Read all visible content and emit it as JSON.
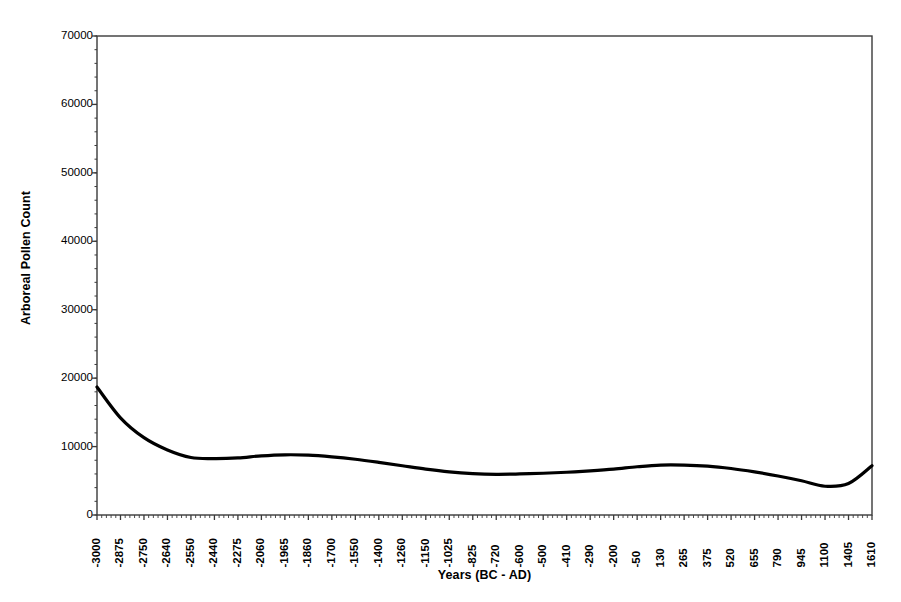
{
  "chart_data": {
    "type": "line",
    "title": "",
    "xlabel": "Years (BC - AD)",
    "ylabel": "Arboreal Pollen Count",
    "ylim": [
      0,
      70000
    ],
    "ytick_values": [
      0,
      10000,
      20000,
      30000,
      40000,
      50000,
      60000,
      70000
    ],
    "ytick_labels": [
      "0",
      "10000",
      "20000",
      "30000",
      "40000",
      "50000",
      "60000",
      "70000"
    ],
    "grid": false,
    "legend": "none",
    "xtick_labels": [
      "-3000",
      "-2875",
      "-2750",
      "-2640",
      "-2550",
      "-2440",
      "-2275",
      "-2060",
      "-1965",
      "-1860",
      "-1700",
      "-1550",
      "-1400",
      "-1260",
      "-1150",
      "-1025",
      "-825",
      "-720",
      "-600",
      "-500",
      "-410",
      "-290",
      "-200",
      "-50",
      "130",
      "265",
      "375",
      "520",
      "655",
      "790",
      "945",
      "1100",
      "1405",
      "1610"
    ],
    "x": [
      "-3000",
      "-2875",
      "-2750",
      "-2640",
      "-2550",
      "-2440",
      "-2275",
      "-2060",
      "-1965",
      "-1860",
      "-1700",
      "-1550",
      "-1400",
      "-1260",
      "-1150",
      "-1025",
      "-825",
      "-720",
      "-600",
      "-500",
      "-410",
      "-290",
      "-200",
      "-50",
      "130",
      "265",
      "375",
      "520",
      "655",
      "790",
      "945",
      "1100",
      "1405",
      "1610"
    ],
    "values": [
      18700,
      14200,
      11300,
      9500,
      8400,
      8250,
      8350,
      8650,
      8800,
      8750,
      8500,
      8150,
      7700,
      7200,
      6700,
      6300,
      6050,
      5950,
      6000,
      6100,
      6250,
      6450,
      6700,
      7050,
      7300,
      7300,
      7150,
      6800,
      6300,
      5700,
      5000,
      4200,
      4600,
      7200
    ],
    "series_color": "#000000",
    "line_width": 3.2,
    "axis_color": "#3a3a3a",
    "background": "#ffffff",
    "plot_area": {
      "left": 97,
      "right": 872,
      "top": 36,
      "bottom": 515
    },
    "minor_ticks_per_interval": 5
  }
}
